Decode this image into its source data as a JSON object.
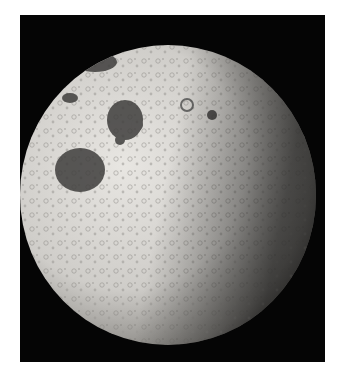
{
  "image": {
    "subject": "Moon photograph (black and white)",
    "background_color": "#050505",
    "page_background": "#ffffff",
    "surface_color": "#d8d6d2",
    "maria_color": "#3a3a3a"
  }
}
